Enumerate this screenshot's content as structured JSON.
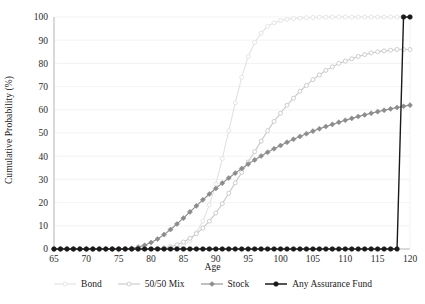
{
  "chart_data": {
    "type": "line",
    "title": "",
    "xlabel": "Age",
    "ylabel": "Cumulative Probability (%)",
    "xlim": [
      65,
      120
    ],
    "ylim": [
      0,
      100
    ],
    "xticks": [
      65,
      70,
      75,
      80,
      85,
      90,
      95,
      100,
      105,
      110,
      115,
      120
    ],
    "yticks": [
      0,
      10,
      20,
      30,
      40,
      50,
      60,
      70,
      80,
      90,
      100
    ],
    "grid": "horizontal",
    "legend_position": "bottom",
    "x": [
      65,
      66,
      67,
      68,
      69,
      70,
      71,
      72,
      73,
      74,
      75,
      76,
      77,
      78,
      79,
      80,
      81,
      82,
      83,
      84,
      85,
      86,
      87,
      88,
      89,
      90,
      91,
      92,
      93,
      94,
      95,
      96,
      97,
      98,
      99,
      100,
      101,
      102,
      103,
      104,
      105,
      106,
      107,
      108,
      109,
      110,
      111,
      112,
      113,
      114,
      115,
      116,
      117,
      118,
      119,
      120
    ],
    "series": [
      {
        "name": "Bond",
        "color": "#e2e2e2",
        "marker": "circle-open",
        "values": [
          0,
          0,
          0,
          0,
          0,
          0,
          0,
          0,
          0,
          0,
          0,
          0,
          0,
          0,
          0,
          0,
          0,
          0,
          0.2,
          0.6,
          1.5,
          3.5,
          7,
          12,
          19,
          28,
          39,
          51,
          63,
          74,
          83,
          89,
          93,
          96,
          97.5,
          98.5,
          99,
          99.3,
          99.5,
          99.7,
          99.8,
          99.9,
          99.9,
          100,
          100,
          100,
          100,
          100,
          100,
          100,
          100,
          100,
          100,
          100,
          100,
          100
        ]
      },
      {
        "name": "50/50 Mix",
        "color": "#c8c8c8",
        "marker": "circle-open",
        "values": [
          0,
          0,
          0,
          0,
          0,
          0,
          0,
          0,
          0,
          0,
          0,
          0,
          0,
          0,
          0,
          0,
          0.2,
          0.5,
          1,
          1.8,
          3,
          4.6,
          6.6,
          9,
          12,
          15.5,
          19.5,
          24,
          28.5,
          33,
          37.5,
          42,
          46.5,
          51,
          55,
          58.5,
          62,
          65,
          68,
          70.5,
          73,
          75,
          77,
          78.5,
          80,
          81,
          82,
          83,
          83.8,
          84.5,
          85,
          85.4,
          85.7,
          86,
          86,
          86
        ]
      },
      {
        "name": "Stock",
        "color": "#8c8c8c",
        "marker": "diamond",
        "values": [
          0,
          0,
          0,
          0,
          0,
          0,
          0,
          0,
          0,
          0,
          0,
          0.1,
          0.3,
          0.8,
          1.6,
          2.8,
          4.3,
          6.2,
          8.4,
          10.8,
          13.3,
          16,
          18.6,
          21.2,
          23.7,
          26.1,
          28.4,
          30.6,
          32.7,
          34.7,
          36.6,
          38.4,
          40.1,
          41.7,
          43.2,
          44.6,
          46,
          47.3,
          48.5,
          49.7,
          50.8,
          51.8,
          52.8,
          53.7,
          54.6,
          55.5,
          56.3,
          57.1,
          57.8,
          58.5,
          59.2,
          59.8,
          60.4,
          61,
          61.5,
          62
        ]
      },
      {
        "name": "Any Assurance Fund",
        "color": "#1a1a1a",
        "marker": "circle-filled",
        "values": [
          0,
          0,
          0,
          0,
          0,
          0,
          0,
          0,
          0,
          0,
          0,
          0,
          0,
          0,
          0,
          0,
          0,
          0,
          0,
          0,
          0,
          0,
          0,
          0,
          0,
          0,
          0,
          0,
          0,
          0,
          0,
          0,
          0,
          0,
          0,
          0,
          0,
          0,
          0,
          0,
          0,
          0,
          0,
          0,
          0,
          0,
          0,
          0,
          0,
          0,
          0,
          0,
          0,
          0,
          100,
          100
        ]
      }
    ]
  },
  "legend": {
    "items": [
      {
        "label": "Bond"
      },
      {
        "label": "50/50 Mix"
      },
      {
        "label": "Stock"
      },
      {
        "label": "Any Assurance Fund"
      }
    ]
  },
  "axes": {
    "y_title": "Cumulative Probability (%)",
    "x_title": "Age"
  },
  "colors": {
    "bond": "#e2e2e2",
    "mix": "#c8c8c8",
    "stock": "#8c8c8c",
    "assurance": "#1a1a1a",
    "grid": "#f0f0f0",
    "axis": "#aaaaaa",
    "background": "#ffffff"
  }
}
